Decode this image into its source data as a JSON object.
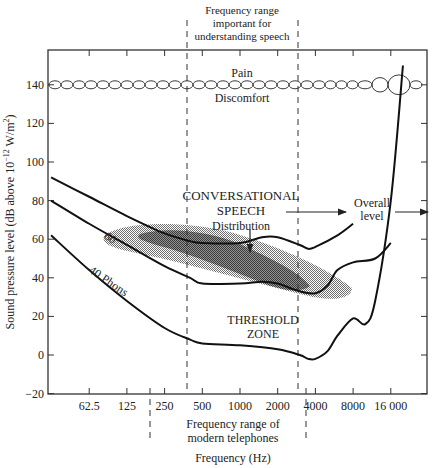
{
  "chart_data": {
    "type": "line",
    "title": "",
    "xlabel": "Frequency (Hz)",
    "ylabel": "Sound pressure level (dB above 10⁻¹² W/m²)",
    "x_scale": "log2",
    "x_ticks": [
      62.5,
      125,
      250,
      500,
      1000,
      2000,
      4000,
      8000,
      16000
    ],
    "x_tick_labels": [
      "62.5",
      "125",
      "250",
      "500",
      "1000",
      "2000",
      "4000",
      "8000",
      "16 000"
    ],
    "y_ticks": [
      -20,
      0,
      20,
      40,
      60,
      80,
      100,
      120,
      140
    ],
    "y_tick_labels": [
      "−20",
      "0",
      "20",
      "40",
      "60",
      "80",
      "100",
      "120",
      "140"
    ],
    "ylim": [
      -20,
      160
    ],
    "xlim": [
      31,
      22000
    ],
    "grid": false,
    "series": [
      {
        "name": "60 Phons",
        "x": [
          31,
          62.5,
          125,
          250,
          400,
          500,
          1000,
          1500,
          2000,
          3000,
          3500,
          4000,
          6000,
          8000
        ],
        "y": [
          92,
          82,
          72,
          63,
          59,
          58,
          58,
          61,
          61,
          57,
          55,
          56,
          62,
          68
        ]
      },
      {
        "name": "40 Phons",
        "x": [
          31,
          62.5,
          125,
          250,
          400,
          500,
          1000,
          1500,
          2000,
          3000,
          4000,
          5000,
          6000,
          8000,
          12000,
          16000
        ],
        "y": [
          80,
          68,
          57,
          46,
          40,
          37,
          37,
          38,
          37,
          33,
          32,
          36,
          44,
          48,
          50,
          58
        ]
      },
      {
        "name": "Threshold",
        "x": [
          31,
          62.5,
          125,
          250,
          400,
          500,
          1000,
          2000,
          3000,
          3500,
          4000,
          5000,
          6000,
          8000,
          10000,
          12000,
          16000,
          20000
        ],
        "y": [
          62,
          44,
          28,
          14,
          8,
          6,
          5,
          3,
          0,
          -2,
          -2,
          2,
          10,
          19,
          16,
          28,
          80,
          150
        ]
      }
    ],
    "bands": [
      {
        "name": "Pain / Discomfort",
        "y": 140,
        "note": "chain of ellipses along 140 dB"
      },
      {
        "name": "Conversational speech distribution",
        "x_range": [
          125,
          8000
        ],
        "y_range": [
          25,
          65
        ]
      }
    ],
    "regions": [
      {
        "name": "Frequency range important for understanding speech",
        "x_range": [
          375,
          3000
        ]
      },
      {
        "name": "Frequency range of modern telephones",
        "x_range": [
          200,
          3400
        ]
      }
    ]
  },
  "annotations": {
    "speech_range": [
      "Frequency range",
      "important for",
      "understanding speech"
    ],
    "pain": "Pain",
    "discomfort": "Discomfort",
    "conv1": "CONVERSATIONAL",
    "conv2": "SPEECH",
    "conv3": "Distribution",
    "overall1": "Overall",
    "overall2": "level",
    "phon60": "60",
    "phon40": "40 Phons",
    "thr1": "THRESHOLD",
    "thr2": "ZONE",
    "tel1": "Frequency range of",
    "tel2": "modern telephones",
    "xlabel": "Frequency (Hz)",
    "ylabel_main": "Sound pressure level (dB above 10",
    "ylabel_sup": "−12",
    "ylabel_tail": " W/m",
    "ylabel_sup2": "2",
    "ylabel_close": ")"
  }
}
